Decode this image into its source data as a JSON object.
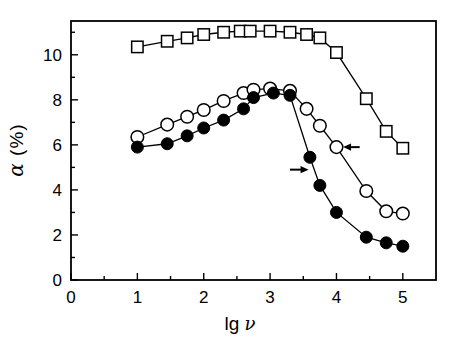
{
  "figure": {
    "background": "#ffffff",
    "frame_color": "#000000"
  },
  "chart_data": {
    "type": "line",
    "xlabel": "lg ν",
    "xlabel_prefix": "lg ",
    "xlabel_symbol": "ν",
    "ylabel": "α (%)",
    "ylabel_symbol": "α",
    "ylabel_rest": " (%)",
    "xlim": [
      0,
      5.5
    ],
    "ylim": [
      0,
      11.5
    ],
    "grid": false,
    "legend": "none",
    "x_major_ticks": [
      0,
      1,
      2,
      3,
      4,
      5
    ],
    "x_tick_labels": [
      "0",
      "1",
      "2",
      "3",
      "4",
      "5"
    ],
    "x_minor_ticks": [
      0.5,
      1.5,
      2.5,
      3.5,
      4.5
    ],
    "y_major_ticks": [
      0,
      2,
      4,
      6,
      8,
      10
    ],
    "y_tick_labels": [
      "0",
      "2",
      "4",
      "6",
      "8",
      "10"
    ],
    "y_minor_ticks": [
      1,
      3,
      5,
      7,
      9,
      11
    ],
    "series": [
      {
        "name": "open-squares",
        "marker": "open-square",
        "color": "#000000",
        "x": [
          1.0,
          1.45,
          1.75,
          2.0,
          2.3,
          2.55,
          2.7,
          3.0,
          3.3,
          3.55,
          3.75,
          4.0,
          4.45,
          4.75,
          5.0
        ],
        "y": [
          10.35,
          10.6,
          10.75,
          10.9,
          11.0,
          11.05,
          11.05,
          11.05,
          11.0,
          10.9,
          10.75,
          10.1,
          8.05,
          6.6,
          5.85
        ]
      },
      {
        "name": "open-circles",
        "marker": "open-circle",
        "color": "#000000",
        "x": [
          1.0,
          1.45,
          1.75,
          2.0,
          2.3,
          2.6,
          2.75,
          3.0,
          3.3,
          3.55,
          3.75,
          4.0,
          4.45,
          4.75,
          5.0
        ],
        "y": [
          6.35,
          6.9,
          7.25,
          7.55,
          7.95,
          8.3,
          8.45,
          8.5,
          8.4,
          7.6,
          6.85,
          5.9,
          3.95,
          3.05,
          2.95
        ]
      },
      {
        "name": "filled-circles",
        "marker": "filled-circle",
        "color": "#000000",
        "x": [
          1.0,
          1.45,
          1.75,
          2.0,
          2.3,
          2.6,
          2.75,
          3.05,
          3.3,
          3.6,
          3.75,
          4.0,
          4.45,
          4.75,
          5.0
        ],
        "y": [
          5.9,
          6.05,
          6.4,
          6.75,
          7.1,
          7.6,
          8.1,
          8.3,
          8.2,
          5.45,
          4.2,
          3.0,
          1.9,
          1.65,
          1.5
        ]
      }
    ],
    "annotations": [
      {
        "type": "arrow",
        "direction": "right",
        "x_from": 3.3,
        "x_to": 3.58,
        "y": 4.9
      },
      {
        "type": "arrow",
        "direction": "left",
        "x_from": 4.35,
        "x_to": 4.1,
        "y": 5.9
      }
    ]
  }
}
